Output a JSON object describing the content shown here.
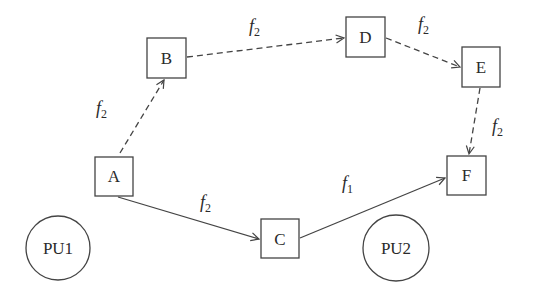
{
  "diagram": {
    "colors": {
      "stroke": "#444444",
      "text": "#2a2a2a",
      "background": "#ffffff"
    },
    "nodes": [
      {
        "id": "A",
        "label": "A",
        "shape": "square",
        "x": 95,
        "y": 157,
        "w": 38,
        "h": 39
      },
      {
        "id": "B",
        "label": "B",
        "shape": "square",
        "x": 147,
        "y": 38,
        "w": 39,
        "h": 40
      },
      {
        "id": "C",
        "label": "C",
        "shape": "square",
        "x": 261,
        "y": 219,
        "w": 38,
        "h": 39
      },
      {
        "id": "D",
        "label": "D",
        "shape": "square",
        "x": 346,
        "y": 17,
        "w": 39,
        "h": 40
      },
      {
        "id": "E",
        "label": "E",
        "shape": "square",
        "x": 462,
        "y": 47,
        "w": 38,
        "h": 40
      },
      {
        "id": "F",
        "label": "F",
        "shape": "square",
        "x": 447,
        "y": 156,
        "w": 39,
        "h": 39
      }
    ],
    "primary_users": [
      {
        "id": "PU1",
        "label": "PU1",
        "cx": 58,
        "cy": 248,
        "r": 32
      },
      {
        "id": "PU2",
        "label": "PU2",
        "cx": 396,
        "cy": 248,
        "r": 33
      }
    ],
    "edges": [
      {
        "from": "A",
        "to": "B",
        "style": "dashed",
        "label_base": "f",
        "label_sub": "2"
      },
      {
        "from": "B",
        "to": "D",
        "style": "dashed",
        "label_base": "f",
        "label_sub": "2"
      },
      {
        "from": "D",
        "to": "E",
        "style": "dashed",
        "label_base": "f",
        "label_sub": "2"
      },
      {
        "from": "E",
        "to": "F",
        "style": "dashed",
        "label_base": "f",
        "label_sub": "2"
      },
      {
        "from": "A",
        "to": "C",
        "style": "solid",
        "label_base": "f",
        "label_sub": "2"
      },
      {
        "from": "C",
        "to": "F",
        "style": "solid",
        "label_base": "f",
        "label_sub": "1"
      }
    ]
  }
}
